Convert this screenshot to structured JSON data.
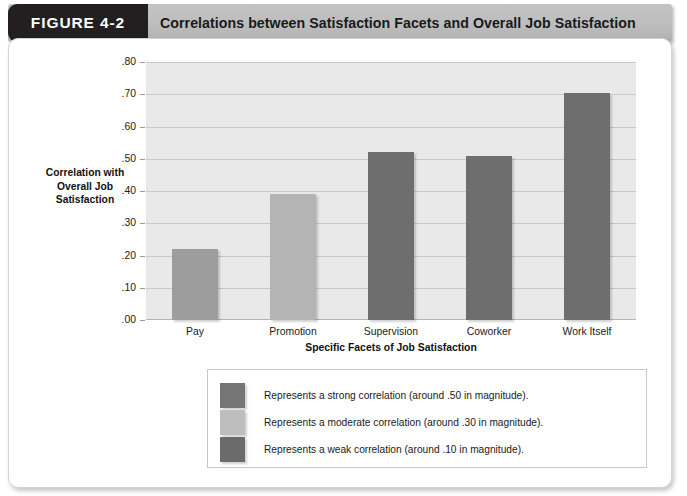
{
  "figure": {
    "tab_label": "FIGURE 4-2",
    "title": "Correlations between Satisfaction Facets and Overall Job Satisfaction"
  },
  "chart_data": {
    "type": "bar",
    "title": "Correlations between Satisfaction Facets and Overall Job Satisfaction",
    "categories": [
      "Pay",
      "Promotion",
      "Supervision",
      "Coworker",
      "Work Itself"
    ],
    "values": [
      0.22,
      0.39,
      0.52,
      0.51,
      0.705
    ],
    "value_labels": [
      ".22",
      ".39",
      ".52",
      ".51",
      ".70"
    ],
    "series": [
      {
        "name": "Correlation with Overall Job Satisfaction",
        "values": [
          0.22,
          0.39,
          0.52,
          0.51,
          0.705
        ]
      }
    ],
    "bar_strength": [
      "moderate",
      "moderate",
      "strong",
      "strong",
      "strong"
    ],
    "bar_colors": [
      "#9d9d9d",
      "#b4b4b4",
      "#6e6e6e",
      "#6e6e6e",
      "#6e6e6e"
    ],
    "xlabel": "Specific Facets of Job Satisfaction",
    "ylabel": "Correlation with Overall Job Satisfaction",
    "ylabel_lines": [
      "Correlation with",
      "Overall Job",
      "Satisfaction"
    ],
    "ylim": [
      0.0,
      0.8
    ],
    "ytick_values": [
      0.0,
      0.1,
      0.2,
      0.3,
      0.4,
      0.5,
      0.6,
      0.7,
      0.8
    ],
    "ytick_labels": [
      ".00",
      ".10",
      ".20",
      ".30",
      ".40",
      ".50",
      ".60",
      ".70",
      ".80"
    ],
    "grid": true,
    "legend_position": "below",
    "plot_background": "#e9e9e9"
  },
  "legend": {
    "items": [
      {
        "color": "#757575",
        "label": "Represents a strong correlation (around .50 in magnitude)."
      },
      {
        "color": "#bebebe",
        "label": "Represents a moderate correlation (around .30 in magnitude)."
      },
      {
        "color": "#6b6b6b",
        "label": "Represents a weak correlation (around .10 in magnitude)."
      }
    ]
  },
  "colors": {
    "tab_background": "#231f20",
    "header_background": "#bdbdbd",
    "panel_background": "#ffffff",
    "plot_background": "#e9e9e9",
    "gridline": "#c9c9c9"
  }
}
